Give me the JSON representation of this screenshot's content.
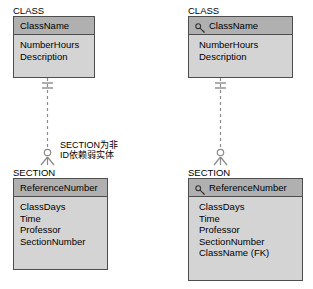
{
  "diagram": {
    "type": "entity-relationship-diagram",
    "notation": "crows-foot",
    "background_color": "#ffffff",
    "entity_fill_color": "#d4d4d4",
    "entity_key_fill_color": "#b0b0b0",
    "entity_border_color": "#4d4d4d",
    "line_color": "#808080"
  },
  "left": {
    "parent": {
      "title": "CLASS",
      "key_attribute": "ClassName",
      "has_key_icon": false,
      "attributes": [
        "NumberHours",
        "Description"
      ]
    },
    "child": {
      "title": "SECTION",
      "key_attribute": "ReferenceNumber",
      "has_key_icon": false,
      "attributes": [
        "ClassDays",
        "Time",
        "Professor",
        "SectionNumber"
      ]
    },
    "relationship": {
      "line_style": "dashed",
      "parent_end": "one-mandatory",
      "child_end": "many-optional"
    },
    "note_line1": "SECTION为非",
    "note_line2": "ID依赖弱实体"
  },
  "right": {
    "parent": {
      "title": "CLASS",
      "key_attribute": "ClassName",
      "has_key_icon": true,
      "attributes": [
        "NumberHours",
        "Description"
      ]
    },
    "child": {
      "title": "SECTION",
      "key_attribute": "ReferenceNumber",
      "has_key_icon": true,
      "attributes": [
        "ClassDays",
        "Time",
        "Professor",
        "SectionNumber",
        "ClassName (FK)"
      ]
    },
    "relationship": {
      "line_style": "dashed",
      "parent_end": "one-mandatory",
      "child_end": "many-optional"
    }
  },
  "icons": {
    "key": "key-icon"
  }
}
